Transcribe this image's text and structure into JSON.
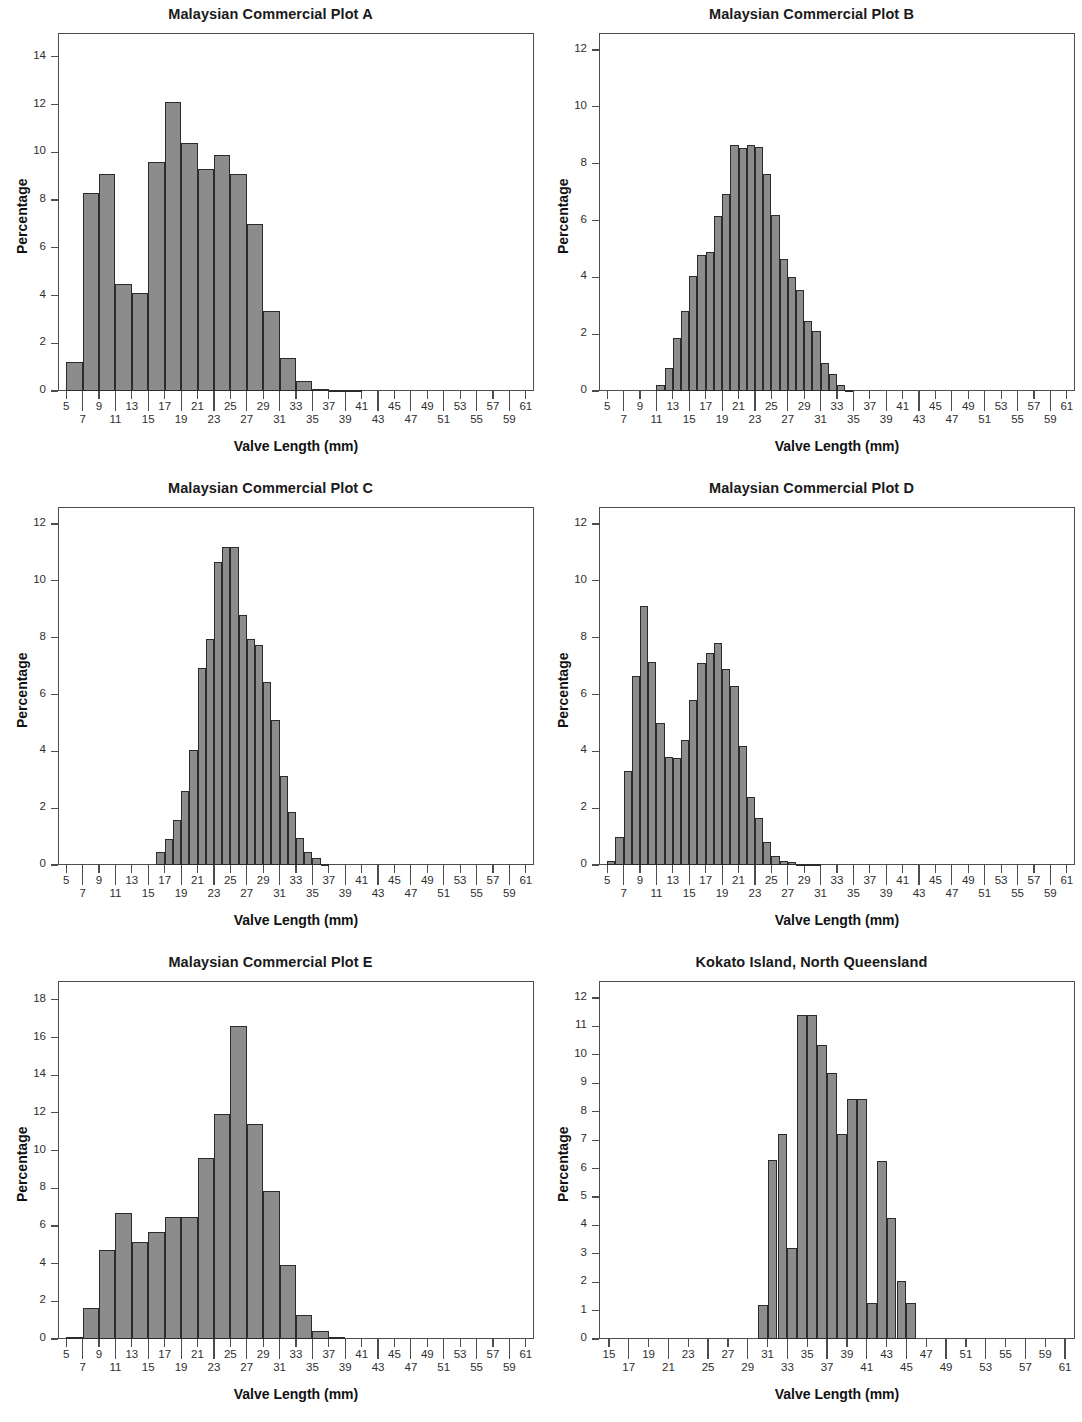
{
  "figure": {
    "panel_count": 6,
    "shared_xlabel": "Valve Length (mm)",
    "shared_ylabel": "Percentage",
    "bar_fill": "#8c8c8c",
    "bar_edge": "#2b2b2b",
    "axis_color": "#4d4d4d"
  },
  "chart_data": [
    {
      "type": "bar",
      "title": "Malaysian Commercial Plot A",
      "xlabel": "Valve Length (mm)",
      "ylabel": "Percentage",
      "xlim": [
        4,
        62
      ],
      "ylim": [
        0,
        15
      ],
      "ytick_values": [
        0,
        2,
        4,
        6,
        8,
        10,
        12,
        14
      ],
      "ytick_labels": [
        "0",
        "2",
        "4",
        "6",
        "8",
        "10",
        "12",
        "14"
      ],
      "xtick_values": [
        5,
        7,
        9,
        11,
        13,
        15,
        17,
        19,
        21,
        23,
        25,
        27,
        29,
        31,
        33,
        35,
        37,
        39,
        41,
        43,
        45,
        47,
        49,
        51,
        53,
        55,
        57,
        59,
        61
      ],
      "xtick_labels": [
        "5",
        "7",
        "9",
        "11",
        "13",
        "15",
        "17",
        "19",
        "21",
        "23",
        "25",
        "27",
        "29",
        "31",
        "33",
        "35",
        "37",
        "39",
        "41",
        "43",
        "45",
        "47",
        "49",
        "51",
        "53",
        "55",
        "57",
        "59",
        "61"
      ],
      "grid": false,
      "legend": "none",
      "bin_width": 2,
      "bin_starts": [
        5,
        7,
        9,
        11,
        13,
        15,
        17,
        19,
        21,
        23,
        25,
        27,
        29,
        31,
        33,
        35,
        37,
        39
      ],
      "values": [
        1.2,
        8.3,
        9.1,
        4.5,
        4.1,
        9.6,
        12.1,
        10.4,
        9.3,
        9.9,
        9.1,
        7.0,
        3.35,
        1.4,
        0.4,
        0.1,
        0.05,
        0.03
      ]
    },
    {
      "type": "bar",
      "title": "Malaysian Commercial Plot B",
      "xlabel": "Valve Length (mm)",
      "ylabel": "Percentage",
      "xlim": [
        4,
        62
      ],
      "ylim": [
        0,
        12.6
      ],
      "ytick_values": [
        0,
        2,
        4,
        6,
        8,
        10,
        12
      ],
      "ytick_labels": [
        "0",
        "2",
        "4",
        "6",
        "8",
        "10",
        "12"
      ],
      "xtick_values": [
        5,
        7,
        9,
        11,
        13,
        15,
        17,
        19,
        21,
        23,
        25,
        27,
        29,
        31,
        33,
        35,
        37,
        39,
        41,
        43,
        45,
        47,
        49,
        51,
        53,
        55,
        57,
        59,
        61
      ],
      "xtick_labels": [
        "5",
        "7",
        "9",
        "11",
        "13",
        "15",
        "17",
        "19",
        "21",
        "23",
        "25",
        "27",
        "29",
        "31",
        "33",
        "35",
        "37",
        "39",
        "41",
        "43",
        "45",
        "47",
        "49",
        "51",
        "53",
        "55",
        "57",
        "59",
        "61"
      ],
      "grid": false,
      "legend": "none",
      "bin_width": 1,
      "bin_starts": [
        11,
        12,
        13,
        14,
        15,
        16,
        17,
        18,
        19,
        20,
        21,
        22,
        23,
        24,
        25,
        26,
        27,
        28,
        29,
        30,
        31,
        32,
        33,
        34
      ],
      "values": [
        0.2,
        0.8,
        1.85,
        2.8,
        4.05,
        4.8,
        4.9,
        6.15,
        6.95,
        8.65,
        8.55,
        8.65,
        8.6,
        7.65,
        6.2,
        4.65,
        4.0,
        3.55,
        2.45,
        2.1,
        1.0,
        0.6,
        0.2,
        0.05
      ]
    },
    {
      "type": "bar",
      "title": "Malaysian Commercial Plot C",
      "xlabel": "Valve Length (mm)",
      "ylabel": "Percentage",
      "xlim": [
        4,
        62
      ],
      "ylim": [
        0,
        12.6
      ],
      "ytick_values": [
        0,
        2,
        4,
        6,
        8,
        10,
        12
      ],
      "ytick_labels": [
        "0",
        "2",
        "4",
        "6",
        "8",
        "10",
        "12"
      ],
      "xtick_values": [
        5,
        7,
        9,
        11,
        13,
        15,
        17,
        19,
        21,
        23,
        25,
        27,
        29,
        31,
        33,
        35,
        37,
        39,
        41,
        43,
        45,
        47,
        49,
        51,
        53,
        55,
        57,
        59,
        61
      ],
      "xtick_labels": [
        "5",
        "7",
        "9",
        "11",
        "13",
        "15",
        "17",
        "19",
        "21",
        "23",
        "25",
        "27",
        "29",
        "31",
        "33",
        "35",
        "37",
        "39",
        "41",
        "43",
        "45",
        "47",
        "49",
        "51",
        "53",
        "55",
        "57",
        "59",
        "61"
      ],
      "grid": false,
      "legend": "none",
      "bin_width": 1,
      "bin_starts": [
        16,
        17,
        18,
        19,
        20,
        21,
        22,
        23,
        24,
        25,
        26,
        27,
        28,
        29,
        30,
        31,
        32,
        33,
        34,
        35,
        36
      ],
      "values": [
        0.45,
        0.9,
        1.6,
        2.6,
        4.05,
        6.95,
        7.95,
        10.65,
        11.2,
        11.2,
        8.8,
        7.95,
        7.75,
        6.45,
        5.1,
        3.15,
        1.85,
        0.95,
        0.45,
        0.25,
        0.05
      ]
    },
    {
      "type": "bar",
      "title": "Malaysian Commercial Plot D",
      "xlabel": "Valve Length (mm)",
      "ylabel": "Percentage",
      "xlim": [
        4,
        62
      ],
      "ylim": [
        0,
        12.6
      ],
      "ytick_values": [
        0,
        2,
        4,
        6,
        8,
        10,
        12
      ],
      "ytick_labels": [
        "0",
        "2",
        "4",
        "6",
        "8",
        "10",
        "12"
      ],
      "xtick_values": [
        5,
        7,
        9,
        11,
        13,
        15,
        17,
        19,
        21,
        23,
        25,
        27,
        29,
        31,
        33,
        35,
        37,
        39,
        41,
        43,
        45,
        47,
        49,
        51,
        53,
        55,
        57,
        59,
        61
      ],
      "xtick_labels": [
        "5",
        "7",
        "9",
        "11",
        "13",
        "15",
        "17",
        "19",
        "21",
        "23",
        "25",
        "27",
        "29",
        "31",
        "33",
        "35",
        "37",
        "39",
        "41",
        "43",
        "45",
        "47",
        "49",
        "51",
        "53",
        "55",
        "57",
        "59",
        "61"
      ],
      "grid": false,
      "legend": "none",
      "bin_width": 1,
      "bin_starts": [
        5,
        6,
        7,
        8,
        9,
        10,
        11,
        12,
        13,
        14,
        15,
        16,
        17,
        18,
        19,
        20,
        21,
        22,
        23,
        24,
        25,
        26,
        27,
        28,
        29,
        30
      ],
      "values": [
        0.15,
        1.0,
        3.3,
        6.65,
        9.1,
        7.15,
        5.0,
        3.8,
        3.75,
        4.4,
        5.8,
        7.1,
        7.45,
        7.8,
        6.9,
        6.3,
        4.2,
        2.4,
        1.65,
        0.8,
        0.3,
        0.15,
        0.1,
        0.05,
        0.03,
        0.02
      ]
    },
    {
      "type": "bar",
      "title": "Malaysian Commercial Plot E",
      "xlabel": "Valve Length (mm)",
      "ylabel": "Percentage",
      "xlim": [
        4,
        62
      ],
      "ylim": [
        0,
        19
      ],
      "ytick_values": [
        0,
        2,
        4,
        6,
        8,
        10,
        12,
        14,
        16,
        18
      ],
      "ytick_labels": [
        "0",
        "2",
        "4",
        "6",
        "8",
        "10",
        "12",
        "14",
        "16",
        "18"
      ],
      "xtick_values": [
        5,
        7,
        9,
        11,
        13,
        15,
        17,
        19,
        21,
        23,
        25,
        27,
        29,
        31,
        33,
        35,
        37,
        39,
        41,
        43,
        45,
        47,
        49,
        51,
        53,
        55,
        57,
        59,
        61
      ],
      "xtick_labels": [
        "5",
        "7",
        "9",
        "11",
        "13",
        "15",
        "17",
        "19",
        "21",
        "23",
        "25",
        "27",
        "29",
        "31",
        "33",
        "35",
        "37",
        "39",
        "41",
        "43",
        "45",
        "47",
        "49",
        "51",
        "53",
        "55",
        "57",
        "59",
        "61"
      ],
      "grid": false,
      "legend": "none",
      "bin_width": 2,
      "bin_starts": [
        5,
        7,
        9,
        11,
        13,
        15,
        17,
        19,
        21,
        23,
        25,
        27,
        29,
        31,
        33,
        35,
        37
      ],
      "values": [
        0.1,
        1.65,
        4.75,
        6.7,
        5.15,
        5.7,
        6.45,
        6.45,
        9.6,
        11.95,
        16.6,
        11.4,
        7.85,
        3.95,
        1.25,
        0.4,
        0.1
      ]
    },
    {
      "type": "bar",
      "title": "Kokato Island, North Queensland",
      "xlabel": "Valve Length (mm)",
      "ylabel": "Percentage",
      "xlim": [
        14,
        62
      ],
      "ylim": [
        0,
        12.6
      ],
      "ytick_values": [
        0,
        1,
        2,
        3,
        4,
        5,
        6,
        7,
        8,
        9,
        10,
        11,
        12
      ],
      "ytick_labels": [
        "0",
        "1",
        "2",
        "3",
        "4",
        "5",
        "6",
        "7",
        "8",
        "9",
        "10",
        "11",
        "12"
      ],
      "xtick_values": [
        15,
        17,
        19,
        21,
        23,
        25,
        27,
        29,
        31,
        33,
        35,
        37,
        39,
        41,
        43,
        45,
        47,
        49,
        51,
        53,
        55,
        57,
        59,
        61
      ],
      "xtick_labels": [
        "15",
        "17",
        "19",
        "21",
        "23",
        "25",
        "27",
        "29",
        "31",
        "33",
        "35",
        "37",
        "39",
        "41",
        "43",
        "45",
        "47",
        "49",
        "51",
        "53",
        "55",
        "57",
        "59",
        "61"
      ],
      "grid": false,
      "legend": "none",
      "bin_width": 1,
      "bin_starts": [
        30,
        31,
        32,
        33,
        34,
        35,
        36,
        37,
        38,
        39,
        40,
        41,
        42,
        43,
        44,
        45
      ],
      "values": [
        1.2,
        6.3,
        7.2,
        3.2,
        11.4,
        11.4,
        10.35,
        9.35,
        7.2,
        8.45,
        8.45,
        1.25,
        6.25,
        4.25,
        2.05,
        1.25
      ]
    }
  ]
}
